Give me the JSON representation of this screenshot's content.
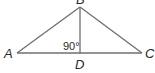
{
  "diagram": {
    "type": "triangle-with-altitude",
    "vertices": {
      "A": {
        "label": "A",
        "x": 17,
        "y": 53
      },
      "B": {
        "label": "B",
        "x": 80,
        "y": 7
      },
      "C": {
        "label": "C",
        "x": 142,
        "y": 53
      },
      "D": {
        "label": "D",
        "x": 80,
        "y": 53
      }
    },
    "segments": [
      "AB",
      "BC",
      "AC",
      "BD"
    ],
    "angle_label": "90°",
    "line_color": "#6f6f6f",
    "text_color": "#2a2a2a"
  }
}
